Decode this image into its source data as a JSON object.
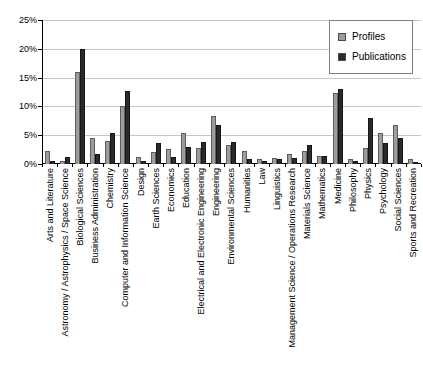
{
  "chart_data": {
    "type": "bar",
    "title": "",
    "xlabel": "",
    "ylabel": "",
    "ylim": [
      0,
      25
    ],
    "ytick_labels": [
      "0%",
      "5%",
      "10%",
      "15%",
      "20%",
      "25%"
    ],
    "grid": "horizontal",
    "legend_position": "top-right",
    "categories": [
      "Arts and Literature",
      "Astronomy / Astrophysics / Space Science",
      "Biological Sciences",
      "Business Administration",
      "Chemistry",
      "Computer and Information Science",
      "Design",
      "Earth Sciences",
      "Economics",
      "Education",
      "Electrical and Electronic Engineering",
      "Engineering",
      "Environmental Sciences",
      "Humanities",
      "Law",
      "Linguistics",
      "Management Science / Operations Research",
      "Materials Science",
      "Mathematics",
      "Medicine",
      "Philosophy",
      "Physics",
      "Psychology",
      "Social Sciences",
      "Sports and Recreation"
    ],
    "series": [
      {
        "name": "Profiles",
        "color": "#9c9c9c",
        "values": [
          2.3,
          0.6,
          16.0,
          4.5,
          4.0,
          10.0,
          1.3,
          2.0,
          2.6,
          5.4,
          2.7,
          8.3,
          3.3,
          2.2,
          0.9,
          1.1,
          1.8,
          2.2,
          1.4,
          12.4,
          0.9,
          2.7,
          5.4,
          6.7,
          0.9
        ]
      },
      {
        "name": "Publications",
        "color": "#2a2a2a",
        "values": [
          0.6,
          1.2,
          20.0,
          1.7,
          5.4,
          12.6,
          0.6,
          3.7,
          1.3,
          2.9,
          3.9,
          6.8,
          3.9,
          0.8,
          0.5,
          0.8,
          1.1,
          3.3,
          1.4,
          13.0,
          0.5,
          8.0,
          3.7,
          4.5,
          0.3
        ]
      }
    ]
  }
}
